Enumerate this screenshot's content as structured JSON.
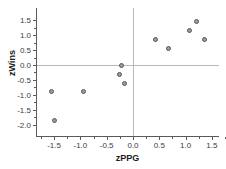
{
  "chart_data": {
    "type": "scatter",
    "title": "",
    "xlabel": "zPPG",
    "ylabel": "zWins",
    "xlim": [
      -1.85,
      1.85
    ],
    "ylim": [
      -2.15,
      1.8
    ],
    "grid": false,
    "legend": null,
    "xticks": [
      "-1.5",
      "-1.0",
      "-0.5",
      "0.0",
      "0.5",
      "1.0",
      "1.5"
    ],
    "xtick_values": [
      -1.5,
      -1.0,
      -0.5,
      0.0,
      0.5,
      1.0,
      1.5
    ],
    "yticks": [
      "1.5",
      "1.0",
      "0.5",
      "0.0",
      "-0.5",
      "-1.0",
      "-1.5",
      "-2.0"
    ],
    "ytick_values": [
      1.5,
      1.0,
      0.5,
      0.0,
      -0.5,
      -1.0,
      -1.5,
      -2.0
    ],
    "reference_lines": [
      {
        "axis": "horizontal",
        "value": 0.0
      },
      {
        "axis": "vertical",
        "value": 0.0
      }
    ],
    "points": [
      {
        "x": -1.55,
        "y": -0.9
      },
      {
        "x": -1.49,
        "y": -1.85
      },
      {
        "x": -0.95,
        "y": -0.9
      },
      {
        "x": -0.25,
        "y": -0.32
      },
      {
        "x": -0.21,
        "y": -0.03
      },
      {
        "x": -0.17,
        "y": -0.61
      },
      {
        "x": 0.42,
        "y": 0.87
      },
      {
        "x": 0.68,
        "y": 0.57
      },
      {
        "x": 1.07,
        "y": 1.16
      },
      {
        "x": 1.2,
        "y": 1.47
      },
      {
        "x": 1.36,
        "y": 0.87
      }
    ],
    "marker": {
      "fill": "#9a9aa4",
      "edge": "#57575e",
      "size": 5,
      "shape": "circle"
    },
    "colors": {
      "axis": "#5a5a5a",
      "reference_line": "#b9b9b9",
      "text": "#1d1d1d",
      "tick_text": "#3c3c3c",
      "background": "#ffffff"
    }
  }
}
